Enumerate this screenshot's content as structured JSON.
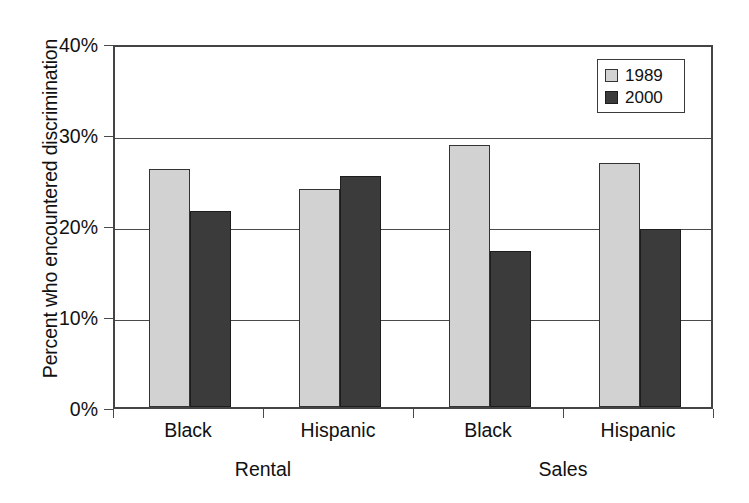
{
  "chart_data": {
    "type": "bar",
    "title": "",
    "xlabel": "",
    "ylabel": "Percent who encountered discrimination",
    "categories": [
      "Black",
      "Hispanic",
      "Black",
      "Hispanic"
    ],
    "group_labels": [
      "Rental",
      "Sales"
    ],
    "series": [
      {
        "name": "1989",
        "color": "#d2d2d2",
        "values": [
          26.2,
          24.0,
          28.8,
          26.8
        ]
      },
      {
        "name": "2000",
        "color": "#3b3b3b",
        "values": [
          21.5,
          25.4,
          17.1,
          19.6
        ]
      }
    ],
    "ylim": [
      0,
      40
    ],
    "yticks": [
      0,
      10,
      20,
      30,
      40
    ],
    "ytick_labels": [
      "0%",
      "10%",
      "20%",
      "30%",
      "40%"
    ],
    "grid": true,
    "grid_axis": "y",
    "legend_position": "top-right",
    "legend_entries": [
      "1989",
      "2000"
    ]
  },
  "axis": {
    "y_title": "Percent who encountered discrimination",
    "ytick_0": "0%",
    "ytick_1": "10%",
    "ytick_2": "20%",
    "ytick_3": "30%",
    "ytick_4": "40%"
  },
  "categories": {
    "c0": "Black",
    "c1": "Hispanic",
    "c2": "Black",
    "c3": "Hispanic"
  },
  "groups": {
    "g0": "Rental",
    "g1": "Sales"
  },
  "legend": {
    "item0": "1989",
    "item1": "2000"
  }
}
